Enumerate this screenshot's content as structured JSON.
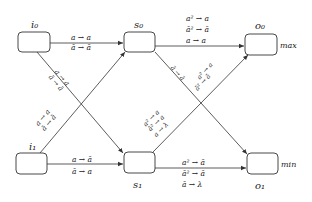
{
  "diagram": {
    "nodes": [
      {
        "id": "i0",
        "label": "i₀",
        "x": 18,
        "y": 32,
        "w": 32,
        "h": 20,
        "label_pos": "above"
      },
      {
        "id": "s0",
        "label": "s₀",
        "x": 124,
        "y": 32,
        "w": 31,
        "h": 20,
        "label_pos": "above"
      },
      {
        "id": "o0",
        "label": "o₀",
        "x": 245,
        "y": 34,
        "w": 32,
        "h": 20,
        "label_pos": "above",
        "side_label": "max"
      },
      {
        "id": "i1",
        "label": "i₁",
        "x": 16,
        "y": 153,
        "w": 31,
        "h": 20,
        "label_pos": "above"
      },
      {
        "id": "s1",
        "label": "s₁",
        "x": 124,
        "y": 152,
        "w": 31,
        "h": 20,
        "label_pos": "below"
      },
      {
        "id": "o1",
        "label": "o₁",
        "x": 247,
        "y": 153,
        "w": 31,
        "h": 20,
        "label_pos": "below",
        "side_label": "min"
      }
    ],
    "edges": [
      {
        "from": "i0",
        "to": "s0",
        "labels": [
          "a → a",
          "ā → ā"
        ]
      },
      {
        "from": "i0",
        "to": "s1",
        "labels": [
          "a → a",
          "ā → ā"
        ]
      },
      {
        "from": "i1",
        "to": "s0",
        "labels": [
          "a → a",
          "ā → ā"
        ]
      },
      {
        "from": "i1",
        "to": "s1",
        "labels": [
          "a → ā",
          "ā → a"
        ]
      },
      {
        "from": "s0",
        "to": "o0",
        "labels": [
          "a² → a",
          "ā² → ā",
          "a → a"
        ]
      },
      {
        "from": "s0",
        "to": "o1",
        "labels": [
          "a² → a",
          "ā² → ā",
          "ā → ā"
        ]
      },
      {
        "from": "s1",
        "to": "o0",
        "labels": [
          "a² → a",
          "ā² → a",
          "a → λ"
        ]
      },
      {
        "from": "s1",
        "to": "o1",
        "labels": [
          "a² → ā",
          "ā² → ā",
          "ā → λ"
        ]
      }
    ],
    "side_labels": {
      "o0": "max",
      "o1": "min"
    }
  }
}
